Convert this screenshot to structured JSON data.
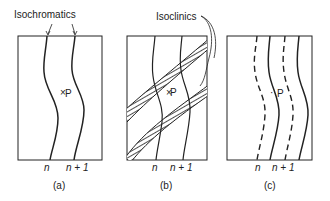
{
  "figure": {
    "panels": [
      {
        "id": "a",
        "caption": "(a)",
        "label": "Isochromatics",
        "point_label": "P",
        "fringe_labels": [
          "n",
          "n + 1"
        ]
      },
      {
        "id": "b",
        "caption": "(b)",
        "label": "Isoclinics",
        "point_label": "P",
        "fringe_labels": [
          "n",
          "n + 1"
        ]
      },
      {
        "id": "c",
        "caption": "(c)",
        "point_label": "P",
        "fringe_labels": [
          "n",
          "n + 1"
        ]
      }
    ],
    "colors": {
      "line": "#222222",
      "background": "#ffffff"
    }
  }
}
